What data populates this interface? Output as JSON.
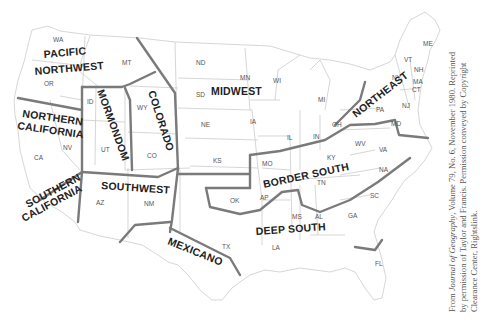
{
  "map": {
    "title": "Dialect regions of the United States",
    "regions": [
      {
        "name": "PACIFIC NORTHWEST",
        "lines": [
          "PACIFIC",
          "NORTHWEST"
        ]
      },
      {
        "name": "NORTHERN CALIFORNIA",
        "lines": [
          "NORTHERN",
          "CALIFORNIA"
        ]
      },
      {
        "name": "SOUTHERN CALIFORNIA",
        "lines": [
          "SOUTHERN",
          "CALIFORNIA"
        ]
      },
      {
        "name": "MORMONDOM",
        "lines": [
          "MORMONDOM"
        ]
      },
      {
        "name": "COLORADO",
        "lines": [
          "COLORADO"
        ]
      },
      {
        "name": "SOUTHWEST",
        "lines": [
          "SOUTHWEST"
        ]
      },
      {
        "name": "MEXICANO",
        "lines": [
          "MEXICANO"
        ]
      },
      {
        "name": "MIDWEST",
        "lines": [
          "MIDWEST"
        ]
      },
      {
        "name": "NORTHEAST",
        "lines": [
          "NORTHEAST"
        ]
      },
      {
        "name": "BORDER SOUTH",
        "lines": [
          "BORDER SOUTH"
        ]
      },
      {
        "name": "DEEP SOUTH",
        "lines": [
          "DEEP SOUTH"
        ]
      }
    ],
    "states": [
      "WA",
      "OR",
      "CA",
      "ID",
      "NV",
      "MT",
      "WY",
      "UT",
      "CO",
      "AZ",
      "NM",
      "ND",
      "SD",
      "NE",
      "KS",
      "OK",
      "TX",
      "MN",
      "IA",
      "MO",
      "AP",
      "LA",
      "WI",
      "IL",
      "MI",
      "IN",
      "OH",
      "KY",
      "TN",
      "MS",
      "AL",
      "GA",
      "FL",
      "SC",
      "NA",
      "VA",
      "WV",
      "PA",
      "NY",
      "VT",
      "NH",
      "MA",
      "CT",
      "NJ",
      "MD",
      "ME"
    ]
  },
  "credit": {
    "prefix": "From ",
    "journal": "Journal of Geography",
    "rest_line1": ", Volume 79, No. 6, November 1980. Reprinted",
    "line2": "by permission of Taylor and Francis. Permission conveyed by Copyright",
    "line3": "Clearance Center, Rightslink."
  },
  "colors": {
    "region_line": "#7a7a7a",
    "state_line": "#b8b8b8",
    "label": "#222222"
  }
}
